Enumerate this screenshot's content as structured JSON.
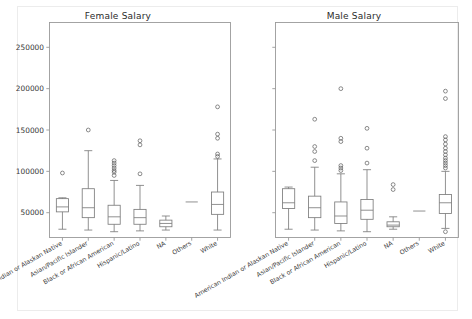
{
  "figure": {
    "background": "#ffffff",
    "border_color": "#ececec",
    "line_color": "#7d7d7d",
    "axis_color": "#9a9a9a",
    "text_color": "#3a3a3a"
  },
  "chart_data": [
    {
      "type": "box",
      "title": "Female Salary",
      "xlabel": "",
      "ylabel": "",
      "ylim": [
        20000,
        280000
      ],
      "grid": false,
      "legend": "none",
      "yticks": [
        50000,
        100000,
        150000,
        200000,
        250000
      ],
      "ytick_labels": [
        "50000",
        "100000",
        "150000",
        "200000",
        "250000"
      ],
      "categories": [
        "American Indian or Alaskan Native",
        "Asian/Pacific Islander",
        "Black or African American",
        "Hispanic/Latino",
        "NA",
        "Others",
        "White"
      ],
      "boxes": [
        {
          "category": "American Indian or Alaskan Native",
          "whisker_low": 30000,
          "q1": 51000,
          "median": 57000,
          "q3": 67000,
          "whisker_high": 68000,
          "fliers": [
            98000
          ]
        },
        {
          "category": "Asian/Pacific Islander",
          "whisker_low": 29000,
          "q1": 44000,
          "median": 56000,
          "q3": 79000,
          "whisker_high": 125000,
          "fliers": [
            150000
          ]
        },
        {
          "category": "Black or African American",
          "whisker_low": 27000,
          "q1": 36000,
          "median": 45000,
          "q3": 59000,
          "whisker_high": 89000,
          "fliers": [
            95000,
            99000,
            101000,
            104000,
            107000,
            110000,
            113000
          ]
        },
        {
          "category": "Hispanic/Latino",
          "whisker_low": 28000,
          "q1": 36000,
          "median": 44000,
          "q3": 54000,
          "whisker_high": 83000,
          "fliers": [
            97000,
            132000,
            137000
          ]
        },
        {
          "category": "NA",
          "whisker_low": 29000,
          "q1": 33000,
          "median": 37000,
          "q3": 41000,
          "whisker_high": 46000,
          "fliers": []
        },
        {
          "category": "Others",
          "whisker_low": 63000,
          "q1": 63000,
          "median": 63000,
          "q3": 63000,
          "whisker_high": 63000,
          "fliers": []
        },
        {
          "category": "White",
          "whisker_low": 29000,
          "q1": 48000,
          "median": 60000,
          "q3": 75000,
          "whisker_high": 115000,
          "fliers": [
            118000,
            121000,
            140000,
            145000,
            178000
          ]
        }
      ]
    },
    {
      "type": "box",
      "title": "Male Salary",
      "xlabel": "",
      "ylabel": "",
      "ylim": [
        20000,
        280000
      ],
      "grid": false,
      "legend": "none",
      "yticks": [
        50000,
        100000,
        150000,
        200000,
        250000
      ],
      "ytick_labels": [
        "",
        "",
        "",
        "",
        ""
      ],
      "categories": [
        "American Indian or Alaskan Native",
        "Asian/Pacific Islander",
        "Black or African American",
        "Hispanic/Latino",
        "NA",
        "Others",
        "White"
      ],
      "boxes": [
        {
          "category": "American Indian or Alaskan Native",
          "whisker_low": 30000,
          "q1": 55000,
          "median": 62000,
          "q3": 79000,
          "whisker_high": 81000,
          "fliers": []
        },
        {
          "category": "Asian/Pacific Islander",
          "whisker_low": 29000,
          "q1": 44000,
          "median": 56000,
          "q3": 70000,
          "whisker_high": 105000,
          "fliers": [
            113000,
            124000,
            130000,
            163000
          ]
        },
        {
          "category": "Black or African American",
          "whisker_low": 28000,
          "q1": 37000,
          "median": 46000,
          "q3": 63000,
          "whisker_high": 97000,
          "fliers": [
            101000,
            104000,
            107000,
            136000,
            140000,
            200000
          ]
        },
        {
          "category": "Hispanic/Latino",
          "whisker_low": 27000,
          "q1": 42000,
          "median": 53000,
          "q3": 66000,
          "whisker_high": 102000,
          "fliers": [
            110000,
            128000,
            152000
          ]
        },
        {
          "category": "NA",
          "whisker_low": 30000,
          "q1": 33000,
          "median": 35000,
          "q3": 39000,
          "whisker_high": 45000,
          "fliers": [
            78000,
            84000
          ]
        },
        {
          "category": "Others",
          "whisker_low": 52000,
          "q1": 52000,
          "median": 52000,
          "q3": 52000,
          "whisker_high": 52000,
          "fliers": []
        },
        {
          "category": "White",
          "whisker_low": 31000,
          "q1": 49000,
          "median": 62000,
          "q3": 72000,
          "whisker_high": 100000,
          "fliers": [
            27000,
            104000,
            107000,
            110000,
            113000,
            116000,
            120000,
            124000,
            128000,
            133000,
            138000,
            142000,
            188000,
            197000
          ]
        }
      ]
    }
  ]
}
